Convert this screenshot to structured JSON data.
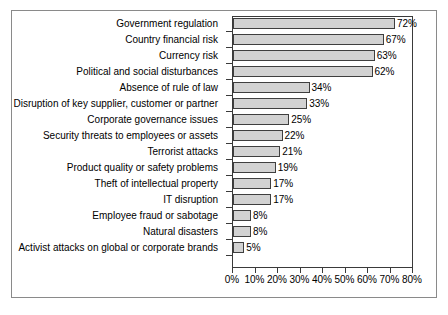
{
  "chart_data": {
    "type": "bar",
    "orientation": "horizontal",
    "title": "",
    "subtitle": "",
    "xlabel": "",
    "ylabel": "",
    "xlim": [
      0,
      80
    ],
    "xtick_labels": [
      "0%",
      "10%",
      "20%",
      "30%",
      "40%",
      "50%",
      "60%",
      "70%",
      "80%"
    ],
    "xtick_values": [
      0,
      10,
      20,
      30,
      40,
      50,
      60,
      70,
      80
    ],
    "grid": false,
    "legend": false,
    "legend_position": "none",
    "value_label_suffix": "%",
    "categories": [
      "Government regulation",
      "Country financial risk",
      "Currency risk",
      "Political and social disturbances",
      "Absence of rule of law",
      "Disruption of key supplier, customer or partner",
      "Corporate governance issues",
      "Security threats to employees or assets",
      "Terrorist attacks",
      "Product quality or safety problems",
      "Theft of intellectual property",
      "IT disruption",
      "Employee fraud or sabotage",
      "Natural disasters",
      "Activist attacks on global or corporate brands"
    ],
    "values": [
      72,
      67,
      63,
      62,
      34,
      33,
      25,
      22,
      21,
      19,
      17,
      17,
      8,
      8,
      5
    ],
    "value_labels": [
      "72%",
      "67%",
      "63%",
      "62%",
      "34%",
      "33%",
      "25%",
      "22%",
      "21%",
      "19%",
      "17%",
      "17%",
      "8%",
      "8%",
      "5%"
    ],
    "colors": {
      "bar_fill": "#d2d2d2",
      "bar_edge": "#3f3f3f",
      "axis": "#3a3a3a",
      "text": "#000000",
      "frame": "#8a8a8a",
      "background": "#ffffff"
    }
  }
}
